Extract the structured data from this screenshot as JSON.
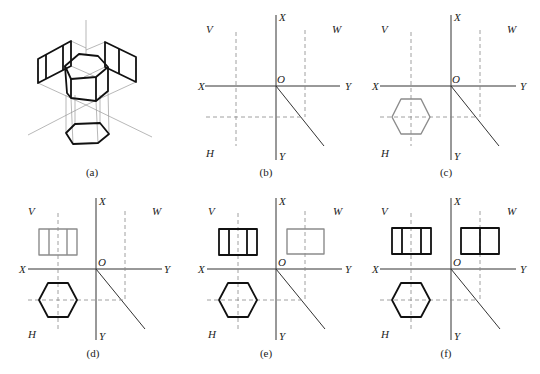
{
  "figure": {
    "panels": [
      {
        "id": "a",
        "caption": "(a)",
        "type": "isometric-view",
        "description": "Hexagonal prism projected onto V, H and W planes"
      },
      {
        "id": "b",
        "caption": "(b)",
        "labels": {
          "v": "V",
          "w": "W",
          "h": "H",
          "x_top": "X",
          "x_left": "X",
          "y_right": "Y",
          "y_bottom": "Y",
          "origin": "O"
        },
        "step": "axes and projection guide lines"
      },
      {
        "id": "c",
        "caption": "(c)",
        "labels": {
          "v": "V",
          "w": "W",
          "h": "H",
          "x_top": "X",
          "x_left": "X",
          "y_right": "Y",
          "y_bottom": "Y",
          "origin": "O"
        },
        "step": "draw top view (hexagon) in H"
      },
      {
        "id": "d",
        "caption": "(d)",
        "labels": {
          "v": "V",
          "w": "W",
          "h": "H",
          "x_top": "X",
          "x_left": "X",
          "y_right": "Y",
          "y_bottom": "Y",
          "origin": "O"
        },
        "step": "draw front view in V"
      },
      {
        "id": "e",
        "caption": "(e)",
        "labels": {
          "v": "V",
          "w": "W",
          "h": "H",
          "x_top": "X",
          "x_left": "X",
          "y_right": "Y",
          "y_bottom": "Y",
          "origin": "O"
        },
        "step": "draw side view in W"
      },
      {
        "id": "f",
        "caption": "(f)",
        "labels": {
          "v": "V",
          "w": "W",
          "h": "H",
          "x_top": "X",
          "x_left": "X",
          "y_right": "Y",
          "y_bottom": "Y",
          "origin": "O"
        },
        "step": "darken final outlines"
      }
    ],
    "colors": {
      "final_line": "#111111",
      "construction_line": "#8c8c8c",
      "axis": "#333333"
    }
  }
}
